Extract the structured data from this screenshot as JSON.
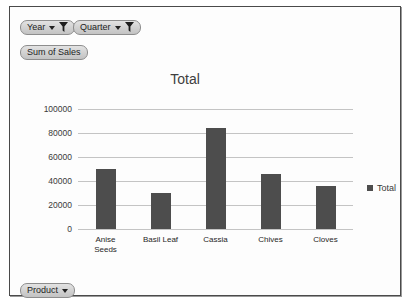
{
  "frame": {
    "name": "pivot-chart-frame"
  },
  "field_buttons": [
    {
      "id": "year",
      "label": "Year",
      "icons": [
        "chevron-down-icon",
        "filter-funnel-icon"
      ]
    },
    {
      "id": "quarter",
      "label": "Quarter",
      "icons": [
        "chevron-down-icon",
        "filter-funnel-icon"
      ]
    },
    {
      "id": "sum",
      "label": "Sum of Sales",
      "icons": []
    },
    {
      "id": "product",
      "label": "Product",
      "icons": [
        "chevron-down-icon"
      ]
    }
  ],
  "legend": {
    "position": "right",
    "entries": [
      {
        "label": "Total",
        "color": "#4d4d4d"
      }
    ]
  },
  "colors": {
    "bar": "#4d4d4d",
    "gridline": "#c4c4c4",
    "frame_border": "#4a4a4a",
    "button_face": "#d2d2d2"
  },
  "chart_data": {
    "type": "bar",
    "title": "Total",
    "xlabel": "",
    "ylabel": "",
    "ylim": [
      0,
      100000
    ],
    "ytick_values": [
      0,
      20000,
      40000,
      60000,
      80000,
      100000
    ],
    "ytick_labels": [
      "0",
      "20000",
      "40000",
      "60000",
      "80000",
      "100000"
    ],
    "grid": true,
    "legend": "right",
    "categories": [
      "Anise Seeds",
      "Basil Leaf",
      "Cassia",
      "Chives",
      "Cloves"
    ],
    "series": [
      {
        "name": "Total",
        "values": [
          50000,
          30000,
          84000,
          46000,
          35500
        ]
      }
    ]
  }
}
